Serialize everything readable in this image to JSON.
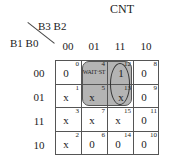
{
  "title": "CNT",
  "col_var_label": "B3 B2",
  "row_var_label": "B1 B0",
  "col_headers": [
    "00",
    "01",
    "11",
    "10"
  ],
  "row_headers": [
    "00",
    "01",
    "11",
    "10"
  ],
  "cells": [
    [
      {
        "value": "0",
        "index": "0"
      },
      {
        "value": "WAIT·ST",
        "index": "4"
      },
      {
        "value": "1",
        "index": "12"
      },
      {
        "value": "0",
        "index": "8"
      }
    ],
    [
      {
        "value": "x",
        "index": "1"
      },
      {
        "value": "x",
        "index": "5"
      },
      {
        "value": "x",
        "index": "13"
      },
      {
        "value": "0",
        "index": "9"
      }
    ],
    [
      {
        "value": "x",
        "index": "3"
      },
      {
        "value": "x",
        "index": "7"
      },
      {
        "value": "x",
        "index": "15"
      },
      {
        "value": "0",
        "index": "11"
      }
    ],
    [
      {
        "value": "x",
        "index": "2"
      },
      {
        "value": "0",
        "index": "6"
      },
      {
        "value": "0",
        "index": "14"
      },
      {
        "value": "0",
        "index": "10"
      }
    ]
  ],
  "colors": {
    "group_fill": "#b4b4b4",
    "grid_line": "#555555"
  }
}
